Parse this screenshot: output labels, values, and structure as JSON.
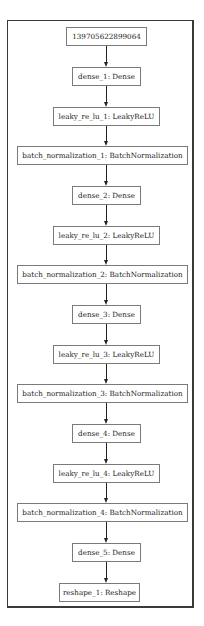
{
  "diagram": {
    "type": "model-graph",
    "nodes": [
      {
        "id": "input",
        "label": "139705622899064"
      },
      {
        "id": "dense_1",
        "label": "dense_1: Dense"
      },
      {
        "id": "leaky_re_lu_1",
        "label": "leaky_re_lu_1: LeakyReLU"
      },
      {
        "id": "batch_normalization_1",
        "label": "batch_normalization_1: BatchNormalization"
      },
      {
        "id": "dense_2",
        "label": "dense_2: Dense"
      },
      {
        "id": "leaky_re_lu_2",
        "label": "leaky_re_lu_2: LeakyReLU"
      },
      {
        "id": "batch_normalization_2",
        "label": "batch_normalization_2: BatchNormalization"
      },
      {
        "id": "dense_3",
        "label": "dense_3: Dense"
      },
      {
        "id": "leaky_re_lu_3",
        "label": "leaky_re_lu_3: LeakyReLU"
      },
      {
        "id": "batch_normalization_3",
        "label": "batch_normalization_3: BatchNormalization"
      },
      {
        "id": "dense_4",
        "label": "dense_4: Dense"
      },
      {
        "id": "leaky_re_lu_4",
        "label": "leaky_re_lu_4: LeakyReLU"
      },
      {
        "id": "batch_normalization_4",
        "label": "batch_normalization_4: BatchNormalization"
      },
      {
        "id": "dense_5",
        "label": "dense_5: Dense"
      },
      {
        "id": "reshape_1",
        "label": "reshape_1: Reshape"
      }
    ],
    "edges": [
      [
        "input",
        "dense_1"
      ],
      [
        "dense_1",
        "leaky_re_lu_1"
      ],
      [
        "leaky_re_lu_1",
        "batch_normalization_1"
      ],
      [
        "batch_normalization_1",
        "dense_2"
      ],
      [
        "dense_2",
        "leaky_re_lu_2"
      ],
      [
        "leaky_re_lu_2",
        "batch_normalization_2"
      ],
      [
        "batch_normalization_2",
        "dense_3"
      ],
      [
        "dense_3",
        "leaky_re_lu_3"
      ],
      [
        "leaky_re_lu_3",
        "batch_normalization_3"
      ],
      [
        "batch_normalization_3",
        "dense_4"
      ],
      [
        "dense_4",
        "leaky_re_lu_4"
      ],
      [
        "leaky_re_lu_4",
        "batch_normalization_4"
      ],
      [
        "batch_normalization_4",
        "dense_5"
      ],
      [
        "dense_5",
        "reshape_1"
      ]
    ]
  }
}
